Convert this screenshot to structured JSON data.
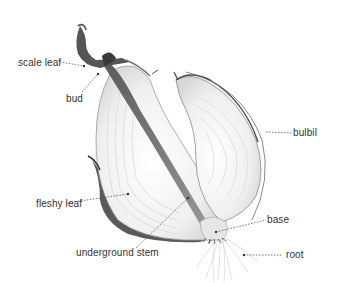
{
  "diagram": {
    "labels": {
      "scale_leaf": "scale leaf",
      "bud": "bud",
      "bulbil": "bulbil",
      "fleshy_leaf": "fleshy leaf",
      "underground_stem": "underground stem",
      "base": "base",
      "root": "root"
    },
    "colors": {
      "background": "#ffffff",
      "label_text": "#333333",
      "leader_line": "#555555",
      "flesh": "#f2f2f2",
      "skin_dark": "#3a3a3a",
      "skin_mid": "#7a7a7a"
    }
  }
}
